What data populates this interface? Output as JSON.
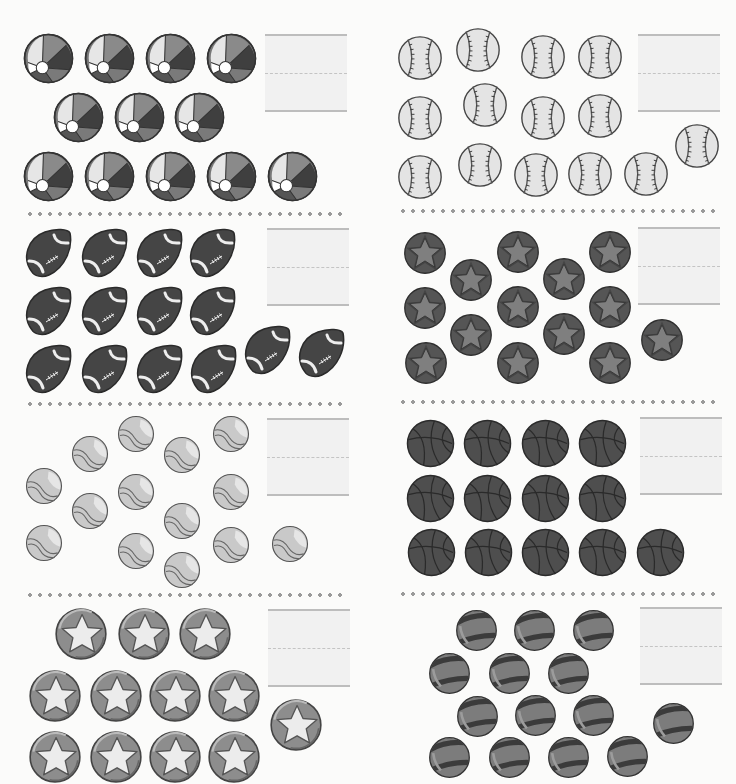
{
  "worksheet": {
    "title": "",
    "panels": [
      {
        "id": "beach-balls",
        "object": "beach-ball",
        "count": 12,
        "answer": "",
        "diameter": 51,
        "answer_box": {
          "x": 265,
          "y": 34
        },
        "items": [
          [
            48,
            58
          ],
          [
            109,
            58
          ],
          [
            170,
            58
          ],
          [
            231,
            58
          ],
          [
            78,
            117
          ],
          [
            139,
            117
          ],
          [
            199,
            117
          ],
          [
            48,
            176
          ],
          [
            109,
            176
          ],
          [
            170,
            176
          ],
          [
            231,
            176
          ],
          [
            292,
            176
          ]
        ]
      },
      {
        "id": "baseballs",
        "object": "baseball",
        "count": 14,
        "answer": "",
        "diameter": 46,
        "answer_box": {
          "x": 638,
          "y": 34
        },
        "items": [
          [
            420,
            58
          ],
          [
            478,
            50
          ],
          [
            543,
            57
          ],
          [
            600,
            57
          ],
          [
            420,
            118
          ],
          [
            485,
            105
          ],
          [
            543,
            118
          ],
          [
            600,
            116
          ],
          [
            420,
            177
          ],
          [
            480,
            165
          ],
          [
            536,
            175
          ],
          [
            590,
            174
          ],
          [
            646,
            174
          ],
          [
            697,
            146
          ]
        ]
      },
      {
        "id": "footballs",
        "object": "football",
        "count": 14,
        "answer": "",
        "diameter": 50,
        "answer_box": {
          "x": 267,
          "y": 228
        },
        "items": [
          [
            48,
            253
          ],
          [
            104,
            253
          ],
          [
            159,
            253
          ],
          [
            212,
            253
          ],
          [
            48,
            311
          ],
          [
            104,
            311
          ],
          [
            159,
            311
          ],
          [
            212,
            311
          ],
          [
            48,
            369
          ],
          [
            104,
            369
          ],
          [
            159,
            369
          ],
          [
            213,
            369
          ],
          [
            267,
            350
          ],
          [
            321,
            353
          ]
        ]
      },
      {
        "id": "dark-star-balls",
        "object": "dark-star-ball",
        "count": 14,
        "answer": "",
        "diameter": 44,
        "answer_box": {
          "x": 638,
          "y": 227
        },
        "items": [
          [
            425,
            253
          ],
          [
            471,
            280
          ],
          [
            518,
            252
          ],
          [
            564,
            279
          ],
          [
            610,
            252
          ],
          [
            425,
            308
          ],
          [
            471,
            335
          ],
          [
            518,
            307
          ],
          [
            564,
            334
          ],
          [
            610,
            307
          ],
          [
            426,
            363
          ],
          [
            518,
            363
          ],
          [
            610,
            363
          ],
          [
            662,
            340
          ]
        ]
      },
      {
        "id": "tennis-balls",
        "object": "tennis-ball",
        "count": 14,
        "answer": "",
        "diameter": 38,
        "answer_box": {
          "x": 267,
          "y": 418
        },
        "items": [
          [
            44,
            486
          ],
          [
            90,
            454
          ],
          [
            136,
            434
          ],
          [
            182,
            455
          ],
          [
            231,
            434
          ],
          [
            44,
            543
          ],
          [
            90,
            511
          ],
          [
            136,
            492
          ],
          [
            182,
            521
          ],
          [
            231,
            492
          ],
          [
            136,
            551
          ],
          [
            182,
            570
          ],
          [
            231,
            545
          ],
          [
            290,
            544
          ]
        ]
      },
      {
        "id": "basketballs",
        "object": "basketball",
        "count": 13,
        "answer": "",
        "diameter": 49,
        "answer_box": {
          "x": 640,
          "y": 417
        },
        "items": [
          [
            430,
            443
          ],
          [
            487,
            443
          ],
          [
            545,
            443
          ],
          [
            602,
            443
          ],
          [
            430,
            498
          ],
          [
            487,
            498
          ],
          [
            545,
            498
          ],
          [
            602,
            498
          ],
          [
            431,
            552
          ],
          [
            488,
            552
          ],
          [
            545,
            552
          ],
          [
            602,
            552
          ],
          [
            660,
            552
          ]
        ]
      },
      {
        "id": "light-star-balls",
        "object": "light-star-ball",
        "count": 12,
        "answer": "",
        "diameter": 54,
        "answer_box": {
          "x": 268,
          "y": 609
        },
        "items": [
          [
            81,
            634
          ],
          [
            144,
            634
          ],
          [
            205,
            634
          ],
          [
            55,
            696
          ],
          [
            116,
            696
          ],
          [
            175,
            696
          ],
          [
            234,
            696
          ],
          [
            55,
            757
          ],
          [
            116,
            757
          ],
          [
            175,
            757
          ],
          [
            234,
            757
          ],
          [
            296,
            725
          ]
        ]
      },
      {
        "id": "striped-balls",
        "object": "striped-ball",
        "count": 14,
        "answer": "",
        "diameter": 43,
        "answer_box": {
          "x": 640,
          "y": 607
        },
        "items": [
          [
            476,
            630
          ],
          [
            534,
            630
          ],
          [
            593,
            630
          ],
          [
            449,
            673
          ],
          [
            509,
            673
          ],
          [
            568,
            673
          ],
          [
            477,
            716
          ],
          [
            535,
            715
          ],
          [
            593,
            715
          ],
          [
            449,
            757
          ],
          [
            509,
            757
          ],
          [
            568,
            757
          ],
          [
            627,
            756
          ],
          [
            673,
            723
          ]
        ]
      }
    ],
    "separators": [
      {
        "x": 25,
        "y": 212,
        "width": 320
      },
      {
        "x": 398,
        "y": 209,
        "width": 322
      },
      {
        "x": 25,
        "y": 402,
        "width": 320
      },
      {
        "x": 398,
        "y": 400,
        "width": 322
      },
      {
        "x": 25,
        "y": 593,
        "width": 320
      },
      {
        "x": 398,
        "y": 592,
        "width": 322
      }
    ],
    "colors": {
      "background": "#fbfbfa",
      "answer_box_fill": "#f1f1f1",
      "answer_box_line": "#bdbdbd",
      "separator_dot": "#9a9a9a",
      "ball_dark": "#4d4d4d",
      "ball_mid": "#7e7e7e",
      "ball_light": "#d8d8d8",
      "outline": "#3a3a3a"
    }
  }
}
